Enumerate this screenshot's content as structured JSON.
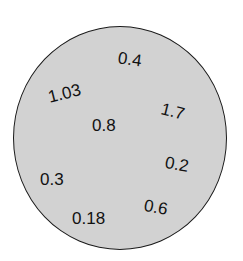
{
  "diagram": {
    "shape": "circle",
    "fill_color": "#d2d2d2",
    "border_color": "#1a1a1a",
    "labels": [
      {
        "text": "0.4",
        "x": 118,
        "y": 51,
        "rotate": 8
      },
      {
        "text": "1.03",
        "x": 48,
        "y": 85,
        "rotate": -14
      },
      {
        "text": "1.7",
        "x": 161,
        "y": 103,
        "rotate": 14
      },
      {
        "text": "0.8",
        "x": 92,
        "y": 117,
        "rotate": 0
      },
      {
        "text": "0.2",
        "x": 165,
        "y": 156,
        "rotate": 10
      },
      {
        "text": "0.3",
        "x": 40,
        "y": 171,
        "rotate": 0
      },
      {
        "text": "0.6",
        "x": 144,
        "y": 199,
        "rotate": 10
      },
      {
        "text": "0.18",
        "x": 72,
        "y": 210,
        "rotate": 0
      }
    ]
  }
}
